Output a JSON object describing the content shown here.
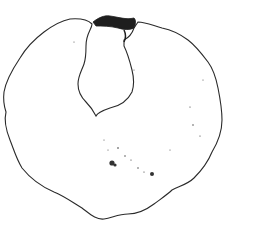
{
  "image": {
    "subject": "line drawing of a round disc with a keyhole-shaped notch",
    "background": "#ffffff",
    "stroke_color": "#2a2a2a",
    "width": 264,
    "height": 228
  },
  "caption": ""
}
